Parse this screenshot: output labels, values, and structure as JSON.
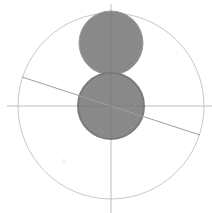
{
  "diagram": {
    "type": "geometric-construction",
    "width": 212,
    "height": 213,
    "colors": {
      "background": "#ffffff",
      "outline": "#c8c8c8",
      "axis": "#bdbdbd",
      "fill": "#8a8a8a",
      "fill_stroke": "#7a7a7a"
    },
    "outer_circle": {
      "cx": 111,
      "cy": 106,
      "r": 93
    },
    "horizontal_axis": {
      "x1": 7,
      "y1": 106,
      "x2": 212,
      "y2": 106
    },
    "vertical_axis": {
      "x1": 111,
      "y1": 4,
      "x2": 111,
      "y2": 213
    },
    "diagonal_line": {
      "x1": 22,
      "y1": 77,
      "x2": 200,
      "y2": 135
    },
    "upper_disk": {
      "cx": 111,
      "cy": 43,
      "r": 32
    },
    "lower_disk": {
      "cx": 111,
      "cy": 106,
      "r": 33
    },
    "faint_mark": {
      "x": 63,
      "y": 163,
      "text": "i"
    }
  }
}
